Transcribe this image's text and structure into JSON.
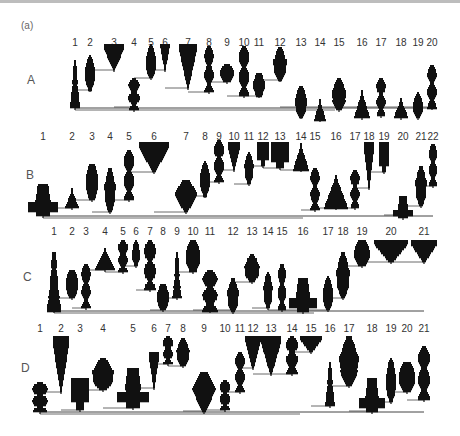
{
  "figure": {
    "panel_label": "(a)",
    "ink_color": "#111111",
    "line_color": "#444444",
    "rows": [
      {
        "label": "A",
        "label_pos": [
          27,
          73
        ],
        "number_y": 37,
        "baseline_y": 108,
        "trunk_x": 75,
        "numbers": [
          {
            "n": "1",
            "x": 75
          },
          {
            "n": "2",
            "x": 90
          },
          {
            "n": "3",
            "x": 114
          },
          {
            "n": "4",
            "x": 134
          },
          {
            "n": "5",
            "x": 151
          },
          {
            "n": "6",
            "x": 165
          },
          {
            "n": "7",
            "x": 188
          },
          {
            "n": "8",
            "x": 209
          },
          {
            "n": "9",
            "x": 227
          },
          {
            "n": "10",
            "x": 244
          },
          {
            "n": "11",
            "x": 259
          },
          {
            "n": "12",
            "x": 280
          },
          {
            "n": "13",
            "x": 301
          },
          {
            "n": "14",
            "x": 320
          },
          {
            "n": "15",
            "x": 339
          },
          {
            "n": "16",
            "x": 362
          },
          {
            "n": "17",
            "x": 381
          },
          {
            "n": "18",
            "x": 401
          },
          {
            "n": "19",
            "x": 418
          },
          {
            "n": "20",
            "x": 432
          }
        ]
      },
      {
        "label": "B",
        "label_pos": [
          26,
          168
        ],
        "number_y": 131,
        "baseline_y": 216,
        "trunk_x": 43,
        "numbers": [
          {
            "n": "1",
            "x": 43
          },
          {
            "n": "2",
            "x": 72
          },
          {
            "n": "3",
            "x": 92
          },
          {
            "n": "4",
            "x": 110
          },
          {
            "n": "5",
            "x": 129
          },
          {
            "n": "6",
            "x": 154
          },
          {
            "n": "7",
            "x": 186
          },
          {
            "n": "8",
            "x": 205
          },
          {
            "n": "9",
            "x": 219
          },
          {
            "n": "10",
            "x": 234
          },
          {
            "n": "11",
            "x": 249
          },
          {
            "n": "12",
            "x": 263
          },
          {
            "n": "13",
            "x": 280
          },
          {
            "n": "14",
            "x": 301
          },
          {
            "n": "15",
            "x": 315
          },
          {
            "n": "16",
            "x": 336
          },
          {
            "n": "17",
            "x": 355
          },
          {
            "n": "18",
            "x": 369
          },
          {
            "n": "19",
            "x": 384
          },
          {
            "n": "20",
            "x": 403
          },
          {
            "n": "21",
            "x": 421
          },
          {
            "n": "22",
            "x": 433
          }
        ]
      },
      {
        "label": "C",
        "label_pos": [
          23,
          270
        ],
        "number_y": 226,
        "baseline_y": 311,
        "trunk_x": 54,
        "numbers": [
          {
            "n": "1",
            "x": 54
          },
          {
            "n": "2",
            "x": 72
          },
          {
            "n": "3",
            "x": 86
          },
          {
            "n": "4",
            "x": 105
          },
          {
            "n": "5",
            "x": 123
          },
          {
            "n": "6",
            "x": 136
          },
          {
            "n": "7",
            "x": 150
          },
          {
            "n": "8",
            "x": 163
          },
          {
            "n": "9",
            "x": 177
          },
          {
            "n": "10",
            "x": 193
          },
          {
            "n": "11",
            "x": 210
          },
          {
            "n": "12",
            "x": 233
          },
          {
            "n": "13",
            "x": 252
          },
          {
            "n": "14",
            "x": 268
          },
          {
            "n": "15",
            "x": 282
          },
          {
            "n": "16",
            "x": 303
          },
          {
            "n": "17",
            "x": 328
          },
          {
            "n": "18",
            "x": 343
          },
          {
            "n": "19",
            "x": 362
          },
          {
            "n": "20",
            "x": 391
          },
          {
            "n": "21",
            "x": 424
          }
        ]
      },
      {
        "label": "D",
        "label_pos": [
          21,
          361
        ],
        "number_y": 323,
        "baseline_y": 412,
        "trunk_x": 40,
        "numbers": [
          {
            "n": "1",
            "x": 40
          },
          {
            "n": "2",
            "x": 61
          },
          {
            "n": "3",
            "x": 80
          },
          {
            "n": "4",
            "x": 103
          },
          {
            "n": "5",
            "x": 133
          },
          {
            "n": "6",
            "x": 154
          },
          {
            "n": "7",
            "x": 168
          },
          {
            "n": "8",
            "x": 183
          },
          {
            "n": "9",
            "x": 204
          },
          {
            "n": "10",
            "x": 225
          },
          {
            "n": "11",
            "x": 240
          },
          {
            "n": "12",
            "x": 253
          },
          {
            "n": "13",
            "x": 271
          },
          {
            "n": "14",
            "x": 292
          },
          {
            "n": "15",
            "x": 311
          },
          {
            "n": "16",
            "x": 330
          },
          {
            "n": "17",
            "x": 349
          },
          {
            "n": "18",
            "x": 372
          },
          {
            "n": "19",
            "x": 391
          },
          {
            "n": "20",
            "x": 407
          },
          {
            "n": "21",
            "x": 424
          }
        ]
      }
    ],
    "glyphs": {
      "A": [
        {
          "x": 75,
          "top": 60,
          "bot": 108,
          "w": 10,
          "shape": "tall"
        },
        {
          "x": 90,
          "top": 55,
          "bot": 90,
          "w": 11,
          "shape": "spindle"
        },
        {
          "x": 114,
          "top": 44,
          "bot": 70,
          "w": 20,
          "shape": "funnel"
        },
        {
          "x": 134,
          "top": 78,
          "bot": 110,
          "w": 12,
          "shape": "stack"
        },
        {
          "x": 151,
          "top": 44,
          "bot": 78,
          "w": 11,
          "shape": "spindle"
        },
        {
          "x": 165,
          "top": 44,
          "bot": 70,
          "w": 9,
          "shape": "funnel"
        },
        {
          "x": 188,
          "top": 44,
          "bot": 88,
          "w": 17,
          "shape": "funnel"
        },
        {
          "x": 209,
          "top": 46,
          "bot": 92,
          "w": 10,
          "shape": "stack"
        },
        {
          "x": 227,
          "top": 64,
          "bot": 82,
          "w": 14,
          "shape": "blob"
        },
        {
          "x": 244,
          "top": 46,
          "bot": 96,
          "w": 11,
          "shape": "stack"
        },
        {
          "x": 259,
          "top": 73,
          "bot": 96,
          "w": 12,
          "shape": "blob"
        },
        {
          "x": 280,
          "top": 47,
          "bot": 80,
          "w": 14,
          "shape": "spindle"
        },
        {
          "x": 301,
          "top": 86,
          "bot": 117,
          "w": 13,
          "shape": "spindle"
        },
        {
          "x": 320,
          "top": 99,
          "bot": 120,
          "w": 12,
          "shape": "cone"
        },
        {
          "x": 339,
          "top": 78,
          "bot": 110,
          "w": 15,
          "shape": "spindle"
        },
        {
          "x": 362,
          "top": 90,
          "bot": 118,
          "w": 16,
          "shape": "cone"
        },
        {
          "x": 381,
          "top": 78,
          "bot": 116,
          "w": 10,
          "shape": "stack"
        },
        {
          "x": 401,
          "top": 98,
          "bot": 118,
          "w": 15,
          "shape": "cone"
        },
        {
          "x": 418,
          "top": 92,
          "bot": 118,
          "w": 11,
          "shape": "spindle"
        },
        {
          "x": 432,
          "top": 65,
          "bot": 108,
          "w": 10,
          "shape": "stack"
        }
      ],
      "B": [
        {
          "x": 43,
          "top": 184,
          "bot": 216,
          "w": 30,
          "shape": "cross"
        },
        {
          "x": 72,
          "top": 188,
          "bot": 208,
          "w": 14,
          "shape": "cone"
        },
        {
          "x": 92,
          "top": 164,
          "bot": 200,
          "w": 13,
          "shape": "blob"
        },
        {
          "x": 110,
          "top": 168,
          "bot": 212,
          "w": 12,
          "shape": "spindle"
        },
        {
          "x": 129,
          "top": 150,
          "bot": 200,
          "w": 11,
          "shape": "stack"
        },
        {
          "x": 154,
          "top": 142,
          "bot": 172,
          "w": 30,
          "shape": "funnel"
        },
        {
          "x": 186,
          "top": 180,
          "bot": 212,
          "w": 24,
          "shape": "diamond"
        },
        {
          "x": 205,
          "top": 161,
          "bot": 196,
          "w": 11,
          "shape": "spindle"
        },
        {
          "x": 219,
          "top": 140,
          "bot": 182,
          "w": 11,
          "shape": "stack"
        },
        {
          "x": 234,
          "top": 142,
          "bot": 170,
          "w": 12,
          "shape": "funnel"
        },
        {
          "x": 249,
          "top": 152,
          "bot": 184,
          "w": 10,
          "shape": "spindle"
        },
        {
          "x": 263,
          "top": 142,
          "bot": 166,
          "w": 12,
          "shape": "block"
        },
        {
          "x": 280,
          "top": 142,
          "bot": 168,
          "w": 18,
          "shape": "block"
        },
        {
          "x": 301,
          "top": 143,
          "bot": 170,
          "w": 16,
          "shape": "cone"
        },
        {
          "x": 315,
          "top": 168,
          "bot": 210,
          "w": 10,
          "shape": "stack"
        },
        {
          "x": 336,
          "top": 175,
          "bot": 208,
          "w": 24,
          "shape": "cone"
        },
        {
          "x": 355,
          "top": 170,
          "bot": 208,
          "w": 10,
          "shape": "stack"
        },
        {
          "x": 369,
          "top": 142,
          "bot": 188,
          "w": 10,
          "shape": "funnel"
        },
        {
          "x": 384,
          "top": 142,
          "bot": 172,
          "w": 11,
          "shape": "block"
        },
        {
          "x": 403,
          "top": 196,
          "bot": 218,
          "w": 20,
          "shape": "cross"
        },
        {
          "x": 421,
          "top": 166,
          "bot": 206,
          "w": 12,
          "shape": "spindle"
        },
        {
          "x": 433,
          "top": 144,
          "bot": 186,
          "w": 9,
          "shape": "stack"
        }
      ],
      "C": [
        {
          "x": 54,
          "top": 252,
          "bot": 311,
          "w": 14,
          "shape": "tall"
        },
        {
          "x": 72,
          "top": 270,
          "bot": 298,
          "w": 13,
          "shape": "blob"
        },
        {
          "x": 86,
          "top": 264,
          "bot": 308,
          "w": 10,
          "shape": "stack"
        },
        {
          "x": 105,
          "top": 248,
          "bot": 270,
          "w": 20,
          "shape": "cone"
        },
        {
          "x": 123,
          "top": 240,
          "bot": 272,
          "w": 11,
          "shape": "stack"
        },
        {
          "x": 136,
          "top": 240,
          "bot": 266,
          "w": 9,
          "shape": "spindle"
        },
        {
          "x": 150,
          "top": 240,
          "bot": 290,
          "w": 13,
          "shape": "stack"
        },
        {
          "x": 163,
          "top": 284,
          "bot": 310,
          "w": 12,
          "shape": "blob"
        },
        {
          "x": 177,
          "top": 252,
          "bot": 298,
          "w": 9,
          "shape": "tall"
        },
        {
          "x": 193,
          "top": 240,
          "bot": 272,
          "w": 15,
          "shape": "blob"
        },
        {
          "x": 210,
          "top": 270,
          "bot": 311,
          "w": 16,
          "shape": "stack"
        },
        {
          "x": 233,
          "top": 278,
          "bot": 312,
          "w": 12,
          "shape": "spindle"
        },
        {
          "x": 252,
          "top": 254,
          "bot": 282,
          "w": 16,
          "shape": "spindle"
        },
        {
          "x": 268,
          "top": 272,
          "bot": 308,
          "w": 10,
          "shape": "spindle"
        },
        {
          "x": 282,
          "top": 264,
          "bot": 310,
          "w": 9,
          "shape": "stack"
        },
        {
          "x": 303,
          "top": 278,
          "bot": 312,
          "w": 28,
          "shape": "cross"
        },
        {
          "x": 328,
          "top": 276,
          "bot": 310,
          "w": 11,
          "shape": "spindle"
        },
        {
          "x": 343,
          "top": 252,
          "bot": 298,
          "w": 14,
          "shape": "spindle"
        },
        {
          "x": 362,
          "top": 240,
          "bot": 266,
          "w": 16,
          "shape": "blob"
        },
        {
          "x": 391,
          "top": 240,
          "bot": 262,
          "w": 34,
          "shape": "funnel"
        },
        {
          "x": 424,
          "top": 240,
          "bot": 262,
          "w": 26,
          "shape": "funnel"
        }
      ],
      "D": [
        {
          "x": 40,
          "top": 382,
          "bot": 412,
          "w": 17,
          "shape": "stack"
        },
        {
          "x": 61,
          "top": 336,
          "bot": 392,
          "w": 16,
          "shape": "funnel"
        },
        {
          "x": 80,
          "top": 378,
          "bot": 410,
          "w": 18,
          "shape": "block"
        },
        {
          "x": 103,
          "top": 358,
          "bot": 390,
          "w": 23,
          "shape": "spindle"
        },
        {
          "x": 133,
          "top": 368,
          "bot": 408,
          "w": 32,
          "shape": "cross"
        },
        {
          "x": 154,
          "top": 352,
          "bot": 388,
          "w": 10,
          "shape": "funnel"
        },
        {
          "x": 168,
          "top": 336,
          "bot": 364,
          "w": 11,
          "shape": "stack"
        },
        {
          "x": 183,
          "top": 338,
          "bot": 366,
          "w": 14,
          "shape": "spindle"
        },
        {
          "x": 204,
          "top": 372,
          "bot": 412,
          "w": 24,
          "shape": "diamond"
        },
        {
          "x": 225,
          "top": 380,
          "bot": 410,
          "w": 11,
          "shape": "stack"
        },
        {
          "x": 240,
          "top": 352,
          "bot": 392,
          "w": 10,
          "shape": "stack"
        },
        {
          "x": 253,
          "top": 336,
          "bot": 368,
          "w": 15,
          "shape": "funnel"
        },
        {
          "x": 271,
          "top": 336,
          "bot": 374,
          "w": 20,
          "shape": "funnel"
        },
        {
          "x": 292,
          "top": 336,
          "bot": 374,
          "w": 13,
          "shape": "stack"
        },
        {
          "x": 311,
          "top": 336,
          "bot": 352,
          "w": 22,
          "shape": "funnel"
        },
        {
          "x": 330,
          "top": 362,
          "bot": 406,
          "w": 10,
          "shape": "tall"
        },
        {
          "x": 349,
          "top": 336,
          "bot": 386,
          "w": 20,
          "shape": "spindle"
        },
        {
          "x": 372,
          "top": 378,
          "bot": 412,
          "w": 26,
          "shape": "cross"
        },
        {
          "x": 391,
          "top": 358,
          "bot": 402,
          "w": 11,
          "shape": "spindle"
        },
        {
          "x": 407,
          "top": 362,
          "bot": 392,
          "w": 17,
          "shape": "blob"
        },
        {
          "x": 424,
          "top": 346,
          "bot": 400,
          "w": 13,
          "shape": "stack"
        }
      ]
    }
  }
}
